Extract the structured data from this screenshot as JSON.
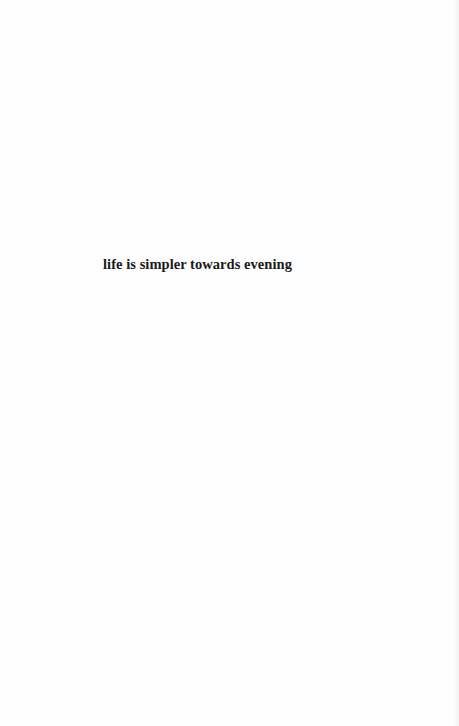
{
  "page": {
    "background_color": "#fefefe",
    "text_color": "#1a1a1a",
    "epigraph": "life is simpler towards evening"
  }
}
